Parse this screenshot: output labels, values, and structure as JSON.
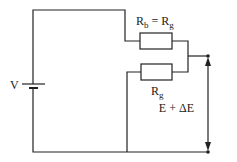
{
  "diagram": {
    "type": "circuit",
    "source_label": "V",
    "resistor_top_label": {
      "main": "R",
      "sub": "b",
      "eq": " = R",
      "sub2": "g"
    },
    "resistor_bottom_label": {
      "main": "R",
      "sub": "g"
    },
    "output_label": "E + ΔE",
    "colors": {
      "line": "#222222",
      "background": "#ffffff"
    }
  }
}
